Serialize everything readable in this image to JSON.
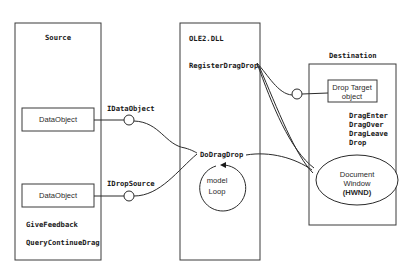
{
  "diagram": {
    "source": {
      "title": "Source",
      "objects": [
        {
          "label": "DataObject"
        },
        {
          "label": "DataObject"
        }
      ],
      "methods": [
        "GiveFeedback",
        "QueryContinueDrag"
      ]
    },
    "interfaces": {
      "data_object": "IDataObject",
      "drop_source": "IDropSource"
    },
    "ole": {
      "title": "OLE2.DLL",
      "register": "RegisterDragDrop",
      "do_drag_drop": "DoDragDrop",
      "loop_line1": "model",
      "loop_line2": "Loop"
    },
    "destination": {
      "title": "Destination",
      "drop_target_line1": "Drop Target",
      "drop_target_line2": "object",
      "methods": [
        "DragEnter",
        "DragOver",
        "DragLeave",
        "Drop"
      ],
      "window_line1": "Document",
      "window_line2": "Window",
      "window_line3": "(HWND)"
    }
  }
}
